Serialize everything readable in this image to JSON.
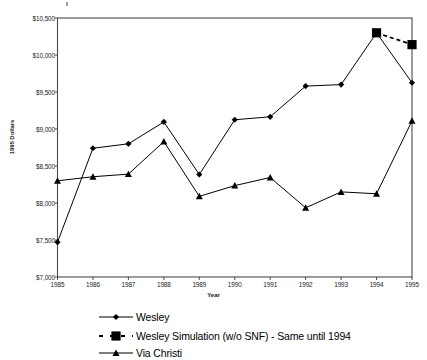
{
  "chart_data": {
    "type": "line",
    "title": "",
    "xlabel": "Year",
    "ylabel": "1995 Dollars",
    "grid": false,
    "legend_position": "bottom",
    "categories": [
      "1985",
      "1986",
      "1987",
      "1988",
      "1989",
      "1990",
      "1991",
      "1992",
      "1993",
      "1994",
      "1995"
    ],
    "x": [
      1985,
      1986,
      1987,
      1988,
      1989,
      1990,
      1991,
      1992,
      1993,
      1994,
      1995
    ],
    "xlim": [
      1985,
      1995
    ],
    "ylim": [
      7000,
      10500
    ],
    "ytick_labels": [
      "$10,500",
      "$10,000",
      "$9,500",
      "$9,000",
      "$8,500",
      "$8,000",
      "$7,500",
      "$7,000"
    ],
    "ytick_values": [
      10500,
      10000,
      9500,
      9000,
      8500,
      8000,
      7500,
      7000
    ],
    "series": [
      {
        "name": "Wesley",
        "marker": "diamond",
        "line_style": "solid",
        "color": "#000000",
        "values": [
          7470,
          8740,
          8800,
          9095,
          8385,
          9125,
          9165,
          9580,
          9600,
          10300,
          9625
        ]
      },
      {
        "name": "Wesley Simulation (w/o SNF) - Same until 1994",
        "marker": "square",
        "line_style": "dashed",
        "color": "#000000",
        "x": [
          1994,
          1995
        ],
        "values": [
          10300,
          10140
        ]
      },
      {
        "name": "Via Christi",
        "marker": "triangle",
        "line_style": "solid",
        "color": "#000000",
        "values": [
          8300,
          8355,
          8390,
          8830,
          8090,
          8235,
          8345,
          7935,
          8150,
          8125,
          9110
        ]
      }
    ]
  },
  "axes": {
    "y_title": "1995 Dollars",
    "x_title": "Year",
    "y_ticks": [
      {
        "label": "$10,500",
        "value": 10500
      },
      {
        "label": "$10,000",
        "value": 10000
      },
      {
        "label": "$9,500",
        "value": 9500
      },
      {
        "label": "$9,000",
        "value": 9000
      },
      {
        "label": "$8,500",
        "value": 8500
      },
      {
        "label": "$8,000",
        "value": 8000
      },
      {
        "label": "$7,500",
        "value": 7500
      },
      {
        "label": "$7,000",
        "value": 7000
      }
    ],
    "x_ticks": [
      "1985",
      "1986",
      "1987",
      "1988",
      "1989",
      "1990",
      "1991",
      "1992",
      "1993",
      "1994",
      "1995"
    ]
  },
  "legend": {
    "entries": [
      {
        "label": "Wesley",
        "marker": "diamond",
        "line_style": "solid"
      },
      {
        "label": "Wesley Simulation (w/o SNF) - Same until 1994",
        "marker": "square",
        "line_style": "dashed"
      },
      {
        "label": "Via Christi",
        "marker": "triangle",
        "line_style": "solid"
      }
    ]
  }
}
